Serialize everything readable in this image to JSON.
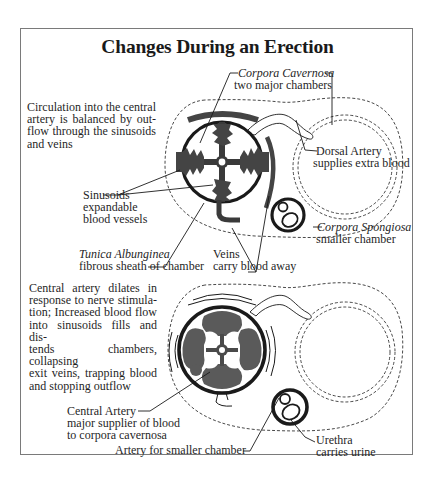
{
  "figure": {
    "title": "Changes During an Erection",
    "colors": {
      "ink": "#1a1a1a",
      "fill": "#555555",
      "frame": "#7a7a7a",
      "background": "#ffffff"
    }
  },
  "top_panel": {
    "description": "Circulation into the central artery is balanced by outflow through the sinusoids and veins",
    "description_lines": [
      "Circulation into the central",
      "artery is balanced by out-",
      "flow through the sinusoids",
      "and veins"
    ],
    "labels": {
      "corpora_cavernosa": {
        "name": "Corpora Cavernosa",
        "note": "two major chambers"
      },
      "dorsal_artery": {
        "name": "Dorsal Artery",
        "note": "supplies extra blood"
      },
      "sinusoids": {
        "name": "Sinusoids",
        "note_line1": "expandable",
        "note_line2": "blood vessels"
      },
      "corpora_spongiosa": {
        "name": "Corpora Spongiosa",
        "note": "smaller chamber"
      },
      "tunica_albunginea": {
        "name": "Tunica Albunginea",
        "note": "fibrous sheath of chamber"
      },
      "veins": {
        "name": "Veins",
        "note": "carry blood away"
      }
    }
  },
  "bottom_panel": {
    "description": "Central artery dilates in response to nerve stimulation; Increased blood flow into sinusoids fills and distends chambers, collapsing exit veins, trapping blood and stopping outflow",
    "description_lines": [
      "Central artery dilates in",
      "response to nerve stimula-",
      "tion; Increased blood flow",
      "into sinusoids fills and dis-",
      "tends chambers, collapsing",
      "exit veins, trapping blood",
      "and stopping outflow"
    ],
    "labels": {
      "central_artery": {
        "name": "Central Artery",
        "note_line1": "major supplier of blood",
        "note_line2": "to corpora cavernosa"
      },
      "artery_smaller_chamber": {
        "name": "Artery for smaller chamber"
      },
      "urethra": {
        "name": "Urethra",
        "note": "carries urine"
      }
    }
  }
}
